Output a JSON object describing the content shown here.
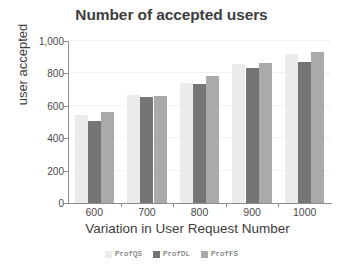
{
  "chart_data": {
    "type": "bar",
    "title": "Number of accepted users",
    "xlabel": "Variation in User Request Number",
    "ylabel": "user accepted",
    "categories": [
      "600",
      "700",
      "800",
      "900",
      "1000"
    ],
    "series": [
      {
        "name": "ProfQS",
        "color": "#ebebeb",
        "values": [
          545,
          665,
          742,
          858,
          922
        ]
      },
      {
        "name": "ProfDL",
        "color": "#757575",
        "values": [
          505,
          655,
          732,
          835,
          870
        ]
      },
      {
        "name": "ProfFS",
        "color": "#aaaaaa",
        "values": [
          560,
          662,
          785,
          862,
          930
        ]
      }
    ],
    "ylim": [
      0,
      1000
    ],
    "yticks": [
      0,
      200,
      400,
      600,
      800,
      1000
    ],
    "ytick_labels": [
      "0",
      "200",
      "400",
      "600",
      "800",
      "1,000"
    ],
    "grid": true,
    "legend_position": "bottom"
  }
}
